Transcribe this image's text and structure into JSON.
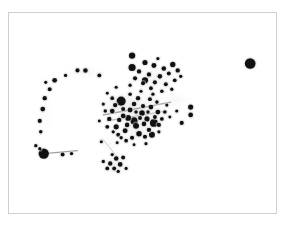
{
  "figure": {
    "title": "",
    "background_color": "#ffffff",
    "frame_color": "#cfcfcf",
    "frame": {
      "x": 8,
      "y": 12,
      "width": 269,
      "height": 202
    }
  },
  "chart_data": {
    "type": "scatter",
    "title": "",
    "xlabel": "",
    "ylabel": "",
    "xlim": [
      0,
      289
    ],
    "ylim": [
      0,
      225
    ],
    "grid": false,
    "legend": "none",
    "axis_ticks_visible": false,
    "point_color": "#111111",
    "haze_color": "#d8d8d8",
    "series": [
      {
        "name": "markers",
        "points": [
          {
            "x": 252,
            "y": 64,
            "r": 5.4
          },
          {
            "x": 44,
            "y": 155,
            "r": 5.2
          },
          {
            "x": 122,
            "y": 102,
            "r": 4.6
          },
          {
            "x": 135,
            "y": 122,
            "r": 3.6
          },
          {
            "x": 155,
            "y": 124,
            "r": 4.0
          },
          {
            "x": 133,
            "y": 68,
            "r": 3.6
          },
          {
            "x": 146,
            "y": 81,
            "r": 3.1
          },
          {
            "x": 153,
            "y": 136,
            "r": 3.0
          },
          {
            "x": 137,
            "y": 127,
            "r": 3.0
          },
          {
            "x": 129,
            "y": 119,
            "r": 2.9
          },
          {
            "x": 143,
            "y": 114,
            "r": 2.8
          },
          {
            "x": 140,
            "y": 135,
            "r": 2.8
          },
          {
            "x": 148,
            "y": 120,
            "r": 2.6
          },
          {
            "x": 117,
            "y": 128,
            "r": 2.6
          },
          {
            "x": 126,
            "y": 132,
            "r": 2.5
          },
          {
            "x": 131,
            "y": 111,
            "r": 2.5
          },
          {
            "x": 152,
            "y": 108,
            "r": 2.4
          },
          {
            "x": 159,
            "y": 113,
            "r": 2.4
          },
          {
            "x": 124,
            "y": 117,
            "r": 2.4
          },
          {
            "x": 113,
            "y": 112,
            "r": 2.4
          },
          {
            "x": 128,
            "y": 126,
            "r": 2.3
          },
          {
            "x": 135,
            "y": 105,
            "r": 2.3
          },
          {
            "x": 145,
            "y": 125,
            "r": 2.3
          },
          {
            "x": 150,
            "y": 131,
            "r": 2.2
          },
          {
            "x": 120,
            "y": 121,
            "r": 2.2
          },
          {
            "x": 110,
            "y": 120,
            "r": 2.2
          },
          {
            "x": 139,
            "y": 99,
            "r": 2.2
          },
          {
            "x": 116,
            "y": 106,
            "r": 2.2
          },
          {
            "x": 144,
            "y": 107,
            "r": 2.1
          },
          {
            "x": 133,
            "y": 139,
            "r": 2.1
          },
          {
            "x": 146,
            "y": 138,
            "r": 2.1
          },
          {
            "x": 160,
            "y": 126,
            "r": 2.1
          },
          {
            "x": 156,
            "y": 118,
            "r": 2.0
          },
          {
            "x": 124,
            "y": 110,
            "r": 2.0
          },
          {
            "x": 108,
            "y": 128,
            "r": 2.0
          },
          {
            "x": 119,
            "y": 136,
            "r": 2.0
          },
          {
            "x": 141,
            "y": 119,
            "r": 2.0
          },
          {
            "x": 151,
            "y": 100,
            "r": 2.0
          },
          {
            "x": 163,
            "y": 120,
            "r": 1.9
          },
          {
            "x": 127,
            "y": 142,
            "r": 1.9
          },
          {
            "x": 113,
            "y": 99,
            "r": 1.9
          },
          {
            "x": 106,
            "y": 112,
            "r": 1.8
          },
          {
            "x": 131,
            "y": 95,
            "r": 1.8
          },
          {
            "x": 158,
            "y": 103,
            "r": 1.8
          },
          {
            "x": 166,
            "y": 113,
            "r": 1.8
          },
          {
            "x": 137,
            "y": 113,
            "r": 1.8
          },
          {
            "x": 149,
            "y": 113,
            "r": 1.7
          },
          {
            "x": 122,
            "y": 139,
            "r": 1.7
          },
          {
            "x": 114,
            "y": 133,
            "r": 1.7
          },
          {
            "x": 154,
            "y": 95,
            "r": 1.7
          },
          {
            "x": 142,
            "y": 92,
            "r": 1.6
          },
          {
            "x": 104,
            "y": 105,
            "r": 1.6
          },
          {
            "x": 168,
            "y": 106,
            "r": 1.6
          },
          {
            "x": 160,
            "y": 133,
            "r": 1.6
          },
          {
            "x": 147,
            "y": 145,
            "r": 1.6
          },
          {
            "x": 135,
            "y": 146,
            "r": 1.5
          },
          {
            "x": 118,
            "y": 144,
            "r": 1.5
          },
          {
            "x": 100,
            "y": 122,
            "r": 1.5
          },
          {
            "x": 171,
            "y": 118,
            "r": 1.5
          },
          {
            "x": 146,
            "y": 63,
            "r": 2.6
          },
          {
            "x": 155,
            "y": 66,
            "r": 2.5
          },
          {
            "x": 165,
            "y": 69,
            "r": 2.3
          },
          {
            "x": 174,
            "y": 65,
            "r": 2.7
          },
          {
            "x": 140,
            "y": 72,
            "r": 2.2
          },
          {
            "x": 150,
            "y": 75,
            "r": 2.2
          },
          {
            "x": 161,
            "y": 77,
            "r": 2.3
          },
          {
            "x": 170,
            "y": 74,
            "r": 2.0
          },
          {
            "x": 179,
            "y": 71,
            "r": 2.2
          },
          {
            "x": 136,
            "y": 79,
            "r": 2.1
          },
          {
            "x": 144,
            "y": 84,
            "r": 2.0
          },
          {
            "x": 156,
            "y": 83,
            "r": 2.1
          },
          {
            "x": 167,
            "y": 85,
            "r": 2.0
          },
          {
            "x": 176,
            "y": 81,
            "r": 1.9
          },
          {
            "x": 152,
            "y": 89,
            "r": 1.9
          },
          {
            "x": 163,
            "y": 92,
            "r": 1.8
          },
          {
            "x": 173,
            "y": 90,
            "r": 1.7
          },
          {
            "x": 131,
            "y": 86,
            "r": 1.7
          },
          {
            "x": 182,
            "y": 77,
            "r": 1.7
          },
          {
            "x": 159,
            "y": 59,
            "r": 1.6
          },
          {
            "x": 192,
            "y": 108,
            "r": 2.6
          },
          {
            "x": 192,
            "y": 116,
            "r": 2.4
          },
          {
            "x": 183,
            "y": 124,
            "r": 2.1
          },
          {
            "x": 178,
            "y": 112,
            "r": 1.6
          },
          {
            "x": 133,
            "y": 56,
            "r": 3.2
          },
          {
            "x": 86,
            "y": 71,
            "r": 2.3
          },
          {
            "x": 78,
            "y": 71,
            "r": 2.1
          },
          {
            "x": 100,
            "y": 76,
            "r": 2.0
          },
          {
            "x": 66,
            "y": 76,
            "r": 1.7
          },
          {
            "x": 55,
            "y": 81,
            "r": 2.4
          },
          {
            "x": 46,
            "y": 83,
            "r": 1.6
          },
          {
            "x": 50,
            "y": 90,
            "r": 2.0
          },
          {
            "x": 45,
            "y": 99,
            "r": 2.2
          },
          {
            "x": 43,
            "y": 110,
            "r": 2.4
          },
          {
            "x": 40,
            "y": 122,
            "r": 2.1
          },
          {
            "x": 41,
            "y": 133,
            "r": 1.8
          },
          {
            "x": 36,
            "y": 147,
            "r": 1.7
          },
          {
            "x": 40,
            "y": 150,
            "r": 1.6
          },
          {
            "x": 63,
            "y": 156,
            "r": 2.0
          },
          {
            "x": 72,
            "y": 155,
            "r": 1.7
          },
          {
            "x": 111,
            "y": 165,
            "r": 2.2
          },
          {
            "x": 117,
            "y": 160,
            "r": 2.3
          },
          {
            "x": 121,
            "y": 166,
            "r": 2.4
          },
          {
            "x": 115,
            "y": 170,
            "r": 2.0
          },
          {
            "x": 108,
            "y": 170,
            "r": 1.9
          },
          {
            "x": 124,
            "y": 159,
            "r": 2.0
          },
          {
            "x": 104,
            "y": 163,
            "r": 1.7
          },
          {
            "x": 119,
            "y": 173,
            "r": 1.7
          },
          {
            "x": 127,
            "y": 170,
            "r": 1.6
          },
          {
            "x": 113,
            "y": 156,
            "r": 1.6
          },
          {
            "x": 102,
            "y": 143,
            "r": 1.6
          },
          {
            "x": 117,
            "y": 88,
            "r": 1.6
          },
          {
            "x": 108,
            "y": 94,
            "r": 1.5
          }
        ]
      }
    ],
    "haze_blobs": [
      {
        "x": 138,
        "y": 112,
        "rx": 34,
        "ry": 26,
        "opacity": 0.16
      },
      {
        "x": 120,
        "y": 104,
        "rx": 20,
        "ry": 14,
        "opacity": 0.14
      },
      {
        "x": 158,
        "y": 78,
        "rx": 26,
        "ry": 16,
        "opacity": 0.1
      },
      {
        "x": 175,
        "y": 101,
        "rx": 22,
        "ry": 10,
        "opacity": 0.08
      },
      {
        "x": 88,
        "y": 73,
        "rx": 26,
        "ry": 8,
        "opacity": 0.07
      },
      {
        "x": 47,
        "y": 110,
        "rx": 8,
        "ry": 30,
        "opacity": 0.05
      },
      {
        "x": 116,
        "y": 166,
        "rx": 16,
        "ry": 12,
        "opacity": 0.07
      },
      {
        "x": 110,
        "y": 146,
        "rx": 12,
        "ry": 16,
        "opacity": 0.06
      },
      {
        "x": 140,
        "y": 132,
        "rx": 22,
        "ry": 14,
        "opacity": 0.1
      }
    ],
    "streaks": [
      {
        "x1": 104,
        "y1": 116,
        "x2": 172,
        "y2": 103,
        "width": 1.4,
        "opacity": 0.35
      },
      {
        "x1": 108,
        "y1": 122,
        "x2": 168,
        "y2": 112,
        "width": 1.2,
        "opacity": 0.28
      },
      {
        "x1": 44,
        "y1": 155,
        "x2": 78,
        "y2": 152,
        "width": 1.1,
        "opacity": 0.4
      },
      {
        "x1": 103,
        "y1": 140,
        "x2": 118,
        "y2": 158,
        "width": 1.0,
        "opacity": 0.2
      }
    ]
  }
}
